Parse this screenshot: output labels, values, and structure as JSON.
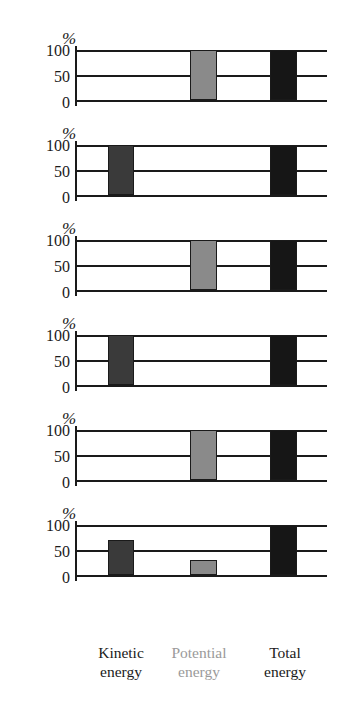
{
  "chart_data": {
    "type": "bar",
    "title": "",
    "subtitle": "",
    "xlabel": "",
    "ylabel": "%",
    "ylim": [
      0,
      100
    ],
    "yticks": [
      "100",
      "50",
      "0"
    ],
    "grid": true,
    "legend_position": "none",
    "categories": [
      "Kinetic energy",
      "Potential energy",
      "Total energy"
    ],
    "category_lines": [
      {
        "line1": "Kinetic",
        "line2": "energy"
      },
      {
        "line1": "Potential",
        "line2": "energy"
      },
      {
        "line1": "Total",
        "line2": "energy"
      }
    ],
    "colors": {
      "kinetic": "#3a3a3a",
      "potential": "#8a8a8a",
      "total": "#161616",
      "axis": "#1a1a1a",
      "potential_label": "#9a9a9a"
    },
    "panel_count": 6,
    "panels": [
      {
        "name": "panel-1",
        "unit": "%",
        "values": [
          0,
          100,
          100
        ]
      },
      {
        "name": "panel-2",
        "unit": "%",
        "values": [
          100,
          0,
          100
        ]
      },
      {
        "name": "panel-3",
        "unit": "%",
        "values": [
          0,
          100,
          100
        ]
      },
      {
        "name": "panel-4",
        "unit": "%",
        "values": [
          100,
          0,
          100
        ]
      },
      {
        "name": "panel-5",
        "unit": "%",
        "values": [
          0,
          100,
          100
        ]
      },
      {
        "name": "panel-6",
        "unit": "%",
        "values": [
          70,
          30,
          100
        ]
      }
    ]
  }
}
